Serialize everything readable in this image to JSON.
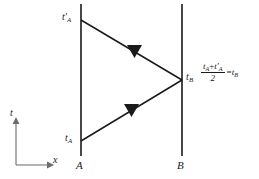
{
  "figure": {
    "background_color": "#ffffff",
    "line_color": "#1a1a1a",
    "width": 259,
    "height": 179
  },
  "worldlines": [
    {
      "name": "A",
      "label": "A",
      "x": 81,
      "y_top": 4,
      "y_bottom": 156
    },
    {
      "name": "B",
      "label": "B",
      "x": 182,
      "y_top": 4,
      "y_bottom": 156
    }
  ],
  "events": {
    "emission": {
      "label_base": "t",
      "label_sub": "A",
      "label_prime": "",
      "label_text": "tA",
      "x": 81,
      "y": 141
    },
    "reflection": {
      "label_base": "t",
      "label_sub": "B",
      "label_prime": "",
      "label_text": "tB",
      "x": 182,
      "y": 80
    },
    "reception": {
      "label_base": "t",
      "label_sub": "A",
      "label_prime": "′",
      "label_text": "t'A",
      "x": 81,
      "y": 20
    }
  },
  "rays": [
    {
      "name": "outgoing-light-ray",
      "from": "emission",
      "to": "reflection",
      "x1": 81,
      "y1": 141,
      "x2": 182,
      "y2": 80,
      "arrow_at": {
        "x": 131,
        "y": 110
      },
      "direction": "A-to-B"
    },
    {
      "name": "returning-light-ray",
      "from": "reflection",
      "to": "reception",
      "x1": 182,
      "y1": 80,
      "x2": 81,
      "y2": 20,
      "arrow_at": {
        "x": 134,
        "y": 51
      },
      "direction": "B-to-A"
    }
  ],
  "axes": {
    "origin": {
      "x": 16,
      "y": 165
    },
    "t_axis": {
      "label": "t",
      "tip": {
        "x": 16,
        "y": 119
      }
    },
    "x_axis": {
      "label": "x",
      "tip": {
        "x": 52,
        "y": 165
      }
    }
  },
  "formula": {
    "numerator_t1_base": "t",
    "numerator_t1_sub": "A",
    "numerator_plus": "+",
    "numerator_t2_base": "t",
    "numerator_t2_prime": "′",
    "numerator_t2_sub": "A",
    "denominator": "2",
    "equals": "=",
    "result_base": "t",
    "result_sub": "B",
    "plain_text": "(tA + t'A)/2 = tB"
  }
}
